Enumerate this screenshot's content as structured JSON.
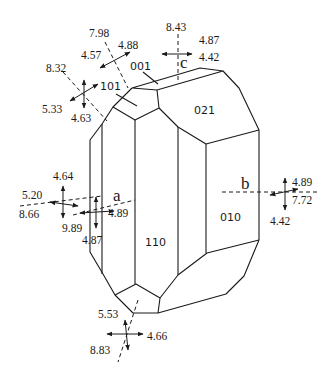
{
  "figure": {
    "type": "crystal morphology diagram",
    "faces": [
      {
        "label": "001",
        "x": 145,
        "y": 70
      },
      {
        "label": "101",
        "x": 115,
        "y": 90
      },
      {
        "label": "021",
        "x": 206,
        "y": 114
      },
      {
        "label": "110",
        "x": 155,
        "y": 246
      },
      {
        "label": "010",
        "x": 231,
        "y": 221
      }
    ],
    "axes": [
      {
        "label": "c",
        "x": 182,
        "y": 68
      },
      {
        "label": "a",
        "x": 118,
        "y": 200
      },
      {
        "label": "b",
        "x": 246,
        "y": 189
      }
    ],
    "growth_rates": {
      "c_group": {
        "top": "8.43",
        "right_upper": "4.87",
        "right_lower": "4.42"
      },
      "001_group": {
        "top": "7.98",
        "left": "4.57",
        "right": "4.88"
      },
      "101_group": {
        "top": "8.32",
        "left": "5.33",
        "bottom": "4.63"
      },
      "a_left_group": {
        "top": "4.64",
        "left": "5.20",
        "left_lower": "8.66",
        "bottom": "9.89"
      },
      "a_right_group": {
        "right": "4.89",
        "bottom": "4.87"
      },
      "b_group": {
        "top": "4.89",
        "right": "7.72",
        "bottom": "4.42"
      },
      "bottom_group": {
        "top": "5.53",
        "right": "4.66",
        "bottom": "8.83"
      }
    },
    "labels": [
      {
        "id": "n_843",
        "text": "8.43",
        "x": 166,
        "y": 31
      },
      {
        "id": "n_487c",
        "text": "4.87",
        "x": 199,
        "y": 44
      },
      {
        "id": "n_442c",
        "text": "4.42",
        "x": 199,
        "y": 61
      },
      {
        "id": "n_798",
        "text": "7.98",
        "x": 75,
        "y": 37
      },
      {
        "id": "n_457",
        "text": "4.57",
        "x": 82,
        "y": 58
      },
      {
        "id": "n_488",
        "text": "4.88",
        "x": 118,
        "y": 49
      },
      {
        "id": "n_832",
        "text": "8.32",
        "x": 45,
        "y": 72
      },
      {
        "id": "n_533",
        "text": "5.33",
        "x": 41,
        "y": 114
      },
      {
        "id": "n_463",
        "text": "4.63",
        "x": 70,
        "y": 122
      },
      {
        "id": "n_464",
        "text": "4.64",
        "x": 53,
        "y": 179
      },
      {
        "id": "n_520",
        "text": "5.20",
        "x": 22,
        "y": 199
      },
      {
        "id": "n_866",
        "text": "8.66",
        "x": 19,
        "y": 217
      },
      {
        "id": "n_989",
        "text": "9.89",
        "x": 62,
        "y": 231
      },
      {
        "id": "n_489a",
        "text": "4.89",
        "x": 108,
        "y": 216
      },
      {
        "id": "n_487a",
        "text": "4.87",
        "x": 82,
        "y": 244
      },
      {
        "id": "n_489b",
        "text": "4.89",
        "x": 292,
        "y": 186
      },
      {
        "id": "n_772",
        "text": "7.72",
        "x": 292,
        "y": 204
      },
      {
        "id": "n_442b",
        "text": "4.42",
        "x": 270,
        "y": 224
      },
      {
        "id": "n_553",
        "text": "5.53",
        "x": 98,
        "y": 317
      },
      {
        "id": "n_466",
        "text": "4.66",
        "x": 147,
        "y": 340
      },
      {
        "id": "n_883",
        "text": "8.83",
        "x": 90,
        "y": 354
      }
    ]
  }
}
